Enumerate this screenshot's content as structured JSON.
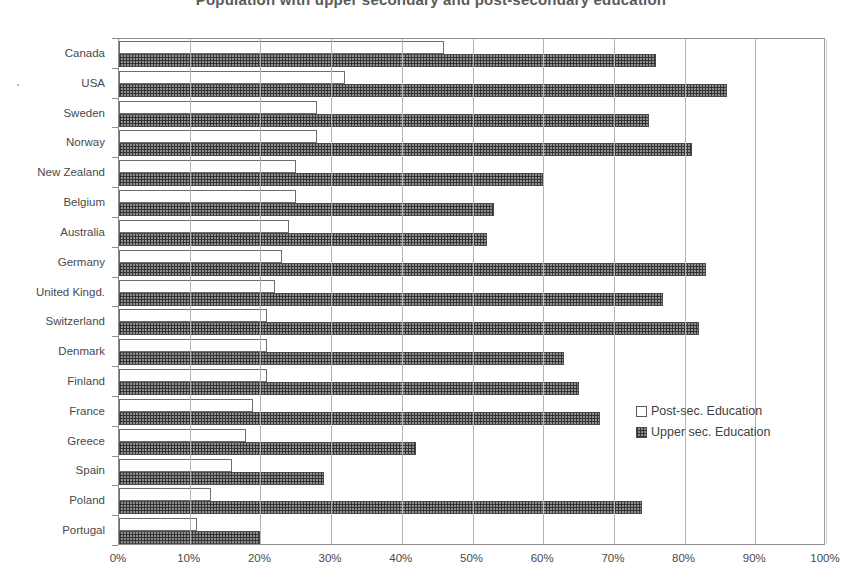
{
  "chart_data": {
    "type": "bar",
    "orientation": "horizontal",
    "title": "Population with upper secondary and post-secondary education",
    "xlabel": "",
    "ylabel": "",
    "xlim": [
      0,
      100
    ],
    "xticks": [
      "0%",
      "10%",
      "20%",
      "30%",
      "40%",
      "50%",
      "60%",
      "70%",
      "80%",
      "90%",
      "100%"
    ],
    "xtick_values": [
      0,
      10,
      20,
      30,
      40,
      50,
      60,
      70,
      80,
      90,
      100
    ],
    "grid": true,
    "legend_position": "center-right",
    "categories": [
      "Canada",
      "USA",
      "Sweden",
      "Norway",
      "New Zealand",
      "Belgium",
      "Australia",
      "Germany",
      "United Kingd.",
      "Switzerland",
      "Denmark",
      "Finland",
      "France",
      "Greece",
      "Spain",
      "Poland",
      "Portugal"
    ],
    "series": [
      {
        "name": "Post-sec. Education",
        "key": "post",
        "color": "#ffffff",
        "values": [
          46,
          32,
          28,
          28,
          25,
          25,
          24,
          23,
          22,
          21,
          21,
          21,
          19,
          18,
          16,
          13,
          11
        ]
      },
      {
        "name": "Upper sec. Education",
        "key": "upper",
        "color": "#8e8e8e",
        "values": [
          76,
          86,
          75,
          81,
          60,
          53,
          52,
          83,
          77,
          82,
          63,
          65,
          68,
          42,
          29,
          74,
          20
        ]
      }
    ]
  },
  "legend": {
    "items": [
      {
        "label": "Post-sec. Education",
        "swatch": "empty-square"
      },
      {
        "label": "Upper sec. Education",
        "swatch": "checkered-square"
      }
    ]
  }
}
